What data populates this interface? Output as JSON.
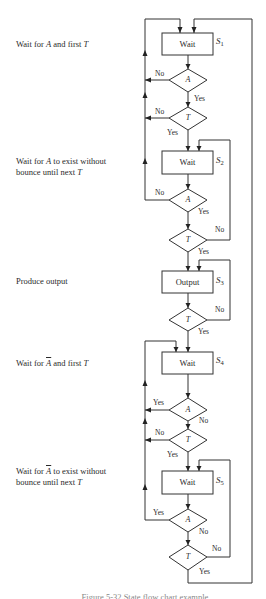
{
  "descriptions": [
    {
      "id": "s1",
      "parts": [
        "Wait for ",
        "A",
        " and first ",
        "T"
      ],
      "overline_A": false
    },
    {
      "id": "s2",
      "line1": [
        "Wait for ",
        "A",
        " to exist without"
      ],
      "line2": [
        "bounce until next ",
        "T"
      ],
      "overline_A": false
    },
    {
      "id": "s3",
      "text": "Produce output"
    },
    {
      "id": "s4",
      "parts": [
        "Wait for ",
        "A",
        " and first ",
        "T"
      ],
      "overline_A": true
    },
    {
      "id": "s5",
      "line1": [
        "Wait for ",
        "A",
        " to exist without"
      ],
      "line2": [
        "bounce until next ",
        "T"
      ],
      "overline_A": true
    }
  ],
  "states": [
    {
      "id": "S1",
      "box_label": "Wait",
      "state_name": "S",
      "subscript": "1"
    },
    {
      "id": "S2",
      "box_label": "Wait",
      "state_name": "S",
      "subscript": "2"
    },
    {
      "id": "S3",
      "box_label": "Output",
      "state_name": "S",
      "subscript": "3"
    },
    {
      "id": "S4",
      "box_label": "Wait",
      "state_name": "S",
      "subscript": "4"
    },
    {
      "id": "S5",
      "box_label": "Wait",
      "state_name": "S",
      "subscript": "5"
    }
  ],
  "decisions": [
    {
      "id": "d1a",
      "var": "A",
      "yes": "Yes",
      "no": "No"
    },
    {
      "id": "d1t",
      "var": "T",
      "yes": "Yes",
      "no": "No"
    },
    {
      "id": "d2a",
      "var": "A",
      "yes": "Yes",
      "no": "No"
    },
    {
      "id": "d2t",
      "var": "T",
      "yes": "Yes",
      "no": "No"
    },
    {
      "id": "d3t",
      "var": "T",
      "yes": "Yes",
      "no": "No"
    },
    {
      "id": "d4a",
      "var": "A",
      "yes": "Yes",
      "no": "No"
    },
    {
      "id": "d4t",
      "var": "T",
      "yes": "Yes",
      "no": "No"
    },
    {
      "id": "d5a",
      "var": "A",
      "yes": "Yes",
      "no": "No"
    },
    {
      "id": "d5t",
      "var": "T",
      "yes": "Yes",
      "no": "No"
    }
  ],
  "caption": "Figure 5-32  State flow chart example"
}
